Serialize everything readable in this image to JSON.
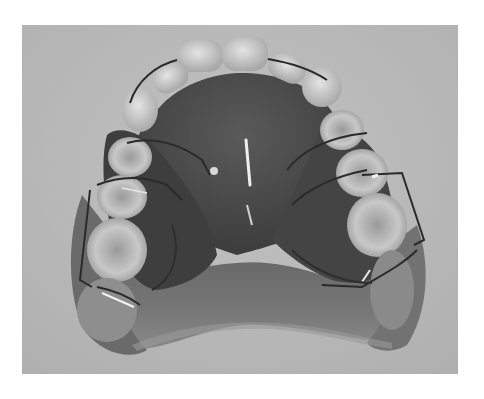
{
  "image": {
    "type": "photograph",
    "subject": "maxillary dental cast with removable orthodontic appliance",
    "color_mode": "grayscale",
    "colors": {
      "page_background": "#ffffff",
      "photo_background": "#b9b9b9",
      "acrylic_plate": "#4a4a4a",
      "cast_base": "#6e6e6e",
      "teeth": "#d6d6d6",
      "wire": "#2a2a2a",
      "wire_highlight": "#f2f2f2"
    },
    "bounds": {
      "x": 22,
      "y": 25,
      "width": 436,
      "height": 349
    }
  }
}
